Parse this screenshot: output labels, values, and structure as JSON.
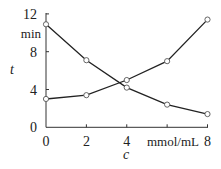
{
  "chart_data": {
    "type": "line",
    "title": "",
    "xlabel": "c",
    "xunit": "mmol/mL",
    "ylabel": "t",
    "yunit": "min",
    "x": [
      0,
      2,
      4,
      6,
      8
    ],
    "x_tick_labels": [
      "0",
      "2",
      "4",
      "",
      "8"
    ],
    "y_ticks": [
      0,
      4,
      8,
      12
    ],
    "y_tick_labels": [
      "0",
      "4",
      "8",
      "12"
    ],
    "xlim": [
      0,
      8
    ],
    "ylim": [
      0,
      12
    ],
    "grid": false,
    "legend": null,
    "marker": "open-circle",
    "line_color": "#222222",
    "series": [
      {
        "name": "decreasing",
        "values": [
          10.9,
          7.1,
          4.2,
          2.4,
          1.4
        ]
      },
      {
        "name": "increasing",
        "values": [
          3.0,
          3.4,
          5.0,
          7.0,
          11.4
        ]
      }
    ]
  }
}
